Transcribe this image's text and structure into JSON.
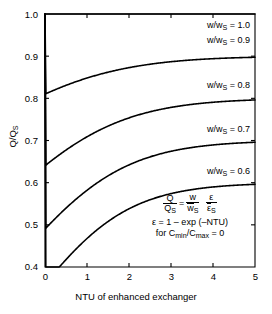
{
  "chart_data": {
    "type": "line",
    "title": "",
    "xlabel": "NTU of enhanced exchanger",
    "ylabel": "Q/Q_S",
    "xlim": [
      0,
      5
    ],
    "ylim": [
      0.4,
      1.0
    ],
    "xticks": [
      "0",
      "1",
      "2",
      "3",
      "4",
      "5"
    ],
    "yticks": [
      "0.4",
      "0.5",
      "0.6",
      "0.7",
      "0.8",
      "0.9",
      "1.0"
    ],
    "grid": false,
    "legend_position": "inline-annotations",
    "series": [
      {
        "name": "w/wS = 1.0",
        "ratio": 1.0,
        "x": [
          0,
          0.25,
          0.5,
          0.75,
          1,
          1.5,
          2,
          2.5,
          3,
          3.5,
          4,
          4.5,
          5
        ],
        "values": [
          1.0,
          1.0,
          1.0,
          1.0,
          1.0,
          1.0,
          1.0,
          1.0,
          1.0,
          1.0,
          1.0,
          1.0,
          1.0
        ]
      },
      {
        "name": "w/wS = 0.9",
        "ratio": 0.9,
        "x": [
          0,
          0.25,
          0.5,
          0.75,
          1,
          1.5,
          2,
          2.5,
          3,
          3.5,
          4,
          4.5,
          5
        ],
        "values": [
          1.0,
          0.988,
          0.977,
          0.968,
          0.96,
          0.945,
          0.934,
          0.926,
          0.92,
          0.915,
          0.912,
          0.909,
          0.907
        ]
      },
      {
        "name": "w/wS = 0.8",
        "ratio": 0.8,
        "x": [
          0,
          0.25,
          0.5,
          0.75,
          1,
          1.5,
          2,
          2.5,
          3,
          3.5,
          4,
          4.5,
          5
        ],
        "values": [
          1.0,
          0.975,
          0.954,
          0.936,
          0.921,
          0.894,
          0.873,
          0.857,
          0.845,
          0.835,
          0.828,
          0.822,
          0.818
        ]
      },
      {
        "name": "w/wS = 0.7",
        "ratio": 0.7,
        "x": [
          0,
          0.25,
          0.5,
          0.75,
          1,
          1.5,
          2,
          2.5,
          3,
          3.5,
          4,
          4.5,
          5
        ],
        "values": [
          1.0,
          0.962,
          0.93,
          0.903,
          0.88,
          0.841,
          0.81,
          0.786,
          0.768,
          0.754,
          0.742,
          0.733,
          0.726
        ]
      },
      {
        "name": "w/wS = 0.6",
        "ratio": 0.6,
        "x": [
          0,
          0.25,
          0.5,
          0.75,
          1,
          1.5,
          2,
          2.5,
          3,
          3.5,
          4,
          4.5,
          5
        ],
        "values": [
          1.0,
          0.948,
          0.905,
          0.868,
          0.836,
          0.785,
          0.743,
          0.711,
          0.686,
          0.667,
          0.652,
          0.64,
          0.631
        ]
      }
    ],
    "annotations": {
      "curve_labels": [
        {
          "text": "w/w",
          "sub": "S",
          "tail": " = 1.0"
        },
        {
          "text": "w/w",
          "sub": "S",
          "tail": " = 0.9"
        },
        {
          "text": "w/w",
          "sub": "S",
          "tail": " = 0.8"
        },
        {
          "text": "w/w",
          "sub": "S",
          "tail": " = 0.7"
        },
        {
          "text": "w/w",
          "sub": "S",
          "tail": " = 0.6"
        }
      ],
      "equation": {
        "line1_num_left": "Q",
        "line1_den_left": "Q",
        "line1_den_left_sub": "S",
        "equals": "=",
        "line1_num_mid": "w",
        "line1_den_mid": "w",
        "line1_den_mid_sub": "S",
        "line1_num_right": "ε",
        "line1_den_right": "ε",
        "line1_den_right_sub": "S",
        "line2": "ε = 1 – exp (–NTU)",
        "line3_pre": "for C",
        "line3_sub1": "min",
        "line3_mid": "/C",
        "line3_sub2": "max",
        "line3_post": " = 0"
      }
    }
  },
  "axes": {
    "x_title": "NTU of enhanced exchanger",
    "y_title_main": "Q/Q",
    "y_title_sub": "S"
  },
  "colors": {
    "ink": "#000000",
    "background": "#ffffff"
  }
}
